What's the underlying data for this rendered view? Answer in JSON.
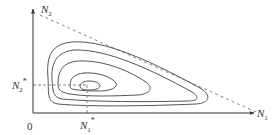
{
  "diagram": {
    "type": "phase-plane",
    "axes": {
      "x_label": {
        "base": "N",
        "sub": "1"
      },
      "y_label": {
        "base": "N",
        "sub": "2"
      },
      "origin_label": "0"
    },
    "equilibrium": {
      "x_label": {
        "base": "N",
        "sub": "1",
        "sup": "*"
      },
      "y_label": {
        "base": "N",
        "sub": "2",
        "sup": "*"
      }
    },
    "elements": [
      "y-axis with arrow",
      "x-axis with arrow",
      "dashed diagonal line",
      "dashed guide lines to equilibrium",
      "nested closed orbits (5)"
    ],
    "colors": {
      "line": "#555555",
      "dashed": "#888888",
      "text": "#333333"
    }
  }
}
